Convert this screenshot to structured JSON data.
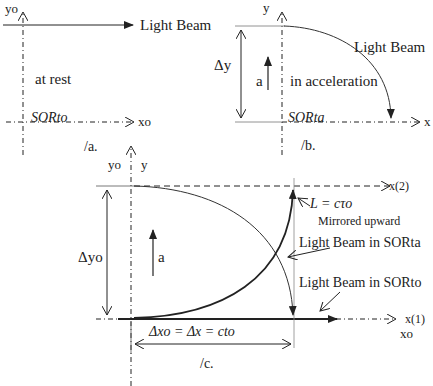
{
  "panel_a": {
    "y_axis_label": "yo",
    "x_axis_label": "xo",
    "beam_label": "Light Beam",
    "state_label": "at rest",
    "frame_label": "SORto",
    "caption": "/a."
  },
  "panel_b": {
    "y_axis_label": "y",
    "x_axis_label": "x",
    "beam_label": "Light Beam",
    "state_label": "in acceleration",
    "delta_label": "Δy",
    "accel_label": "a",
    "frame_label": "SORta",
    "caption": "/b."
  },
  "panel_c": {
    "y0_label": "yo",
    "y_label": "y",
    "delta_label": "Δyo",
    "accel_label": "a",
    "x2_label": "x(2)",
    "x1_label": "x(1)",
    "x0_label": "xo",
    "length_label": "L = cτo",
    "mirror_label": "Mirrored upward",
    "beam_ta_label": "Light Beam in SORta",
    "beam_to_label": "Light Beam in SORto",
    "dx_label": "Δxo = Δx = cto",
    "caption": "/c."
  },
  "colors": {
    "ink": "#222222",
    "thin": "#555555",
    "background": "#ffffff"
  }
}
